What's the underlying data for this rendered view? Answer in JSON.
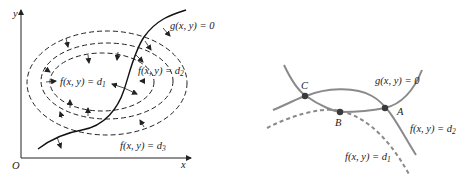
{
  "left_panel": {
    "axes": {
      "x_label": "x",
      "y_label": "y",
      "origin_label": "O"
    },
    "constraint_label": "g(x, y) = 0",
    "contours": [
      {
        "name": "f(x, y) = d",
        "sub": "1"
      },
      {
        "name": "f(x, y) = d",
        "sub": "2"
      },
      {
        "name": "f(x, y) = d",
        "sub": "3"
      }
    ]
  },
  "right_panel": {
    "constraint_label": "g(x, y) = 0",
    "contours": [
      {
        "name": "f(x, y) = d",
        "sub": "2",
        "style": "solid"
      },
      {
        "name": "f(x, y) = d",
        "sub": "1",
        "style": "dashed"
      }
    ],
    "points": [
      {
        "label": "A"
      },
      {
        "label": "B"
      },
      {
        "label": "C"
      }
    ]
  },
  "colors": {
    "ink": "#222222",
    "curve_gray": "#8a8a8a",
    "point": "#3a3a3a",
    "background": "#ffffff"
  }
}
